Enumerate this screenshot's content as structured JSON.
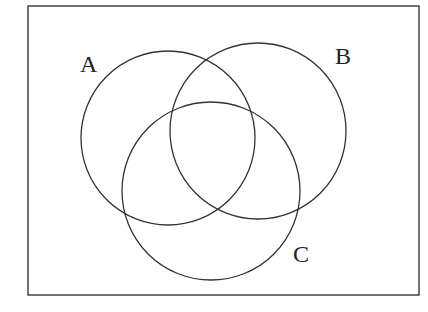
{
  "diagram": {
    "type": "venn",
    "sets": [
      {
        "id": "A",
        "label": "A"
      },
      {
        "id": "B",
        "label": "B"
      },
      {
        "id": "C",
        "label": "C"
      }
    ]
  }
}
